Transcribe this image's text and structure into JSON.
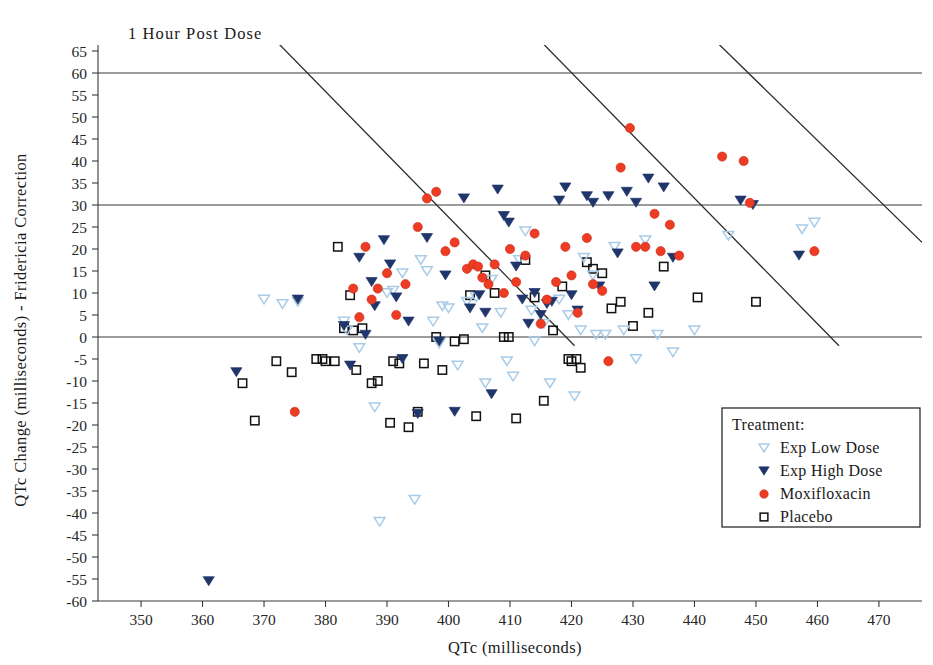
{
  "chart_data": {
    "type": "scatter",
    "title": "1 Hour Post Dose",
    "xlabel": "QTc (milliseconds)",
    "ylabel": "QTc Change (milliseconds) - Fridericia Correction",
    "xlim": [
      343,
      477
    ],
    "ylim": [
      -60,
      65
    ],
    "xticks": [
      350,
      360,
      370,
      380,
      390,
      400,
      410,
      420,
      430,
      440,
      450,
      460,
      470
    ],
    "yticks": [
      65,
      60,
      55,
      50,
      45,
      40,
      35,
      30,
      25,
      20,
      15,
      10,
      5,
      0,
      -5,
      -10,
      -15,
      -20,
      -25,
      -30,
      -35,
      -40,
      -45,
      -50,
      -55,
      -60
    ],
    "grid": false,
    "legend": {
      "position": "bottom-right",
      "title": "Treatment:",
      "entries": [
        {
          "label": "Exp Low Dose",
          "marker": "triangle-down-open",
          "color": "#A8CCE8"
        },
        {
          "label": "Exp High Dose",
          "marker": "triangle-down-filled",
          "color": "#20366B"
        },
        {
          "label": "Moxifloxacin",
          "marker": "circle-filled",
          "color": "#EE3B24"
        },
        {
          "label": "Placebo",
          "marker": "square-open",
          "color": "#111111"
        }
      ]
    },
    "reference_lines": {
      "horizontal": [
        {
          "y": 60,
          "label": ""
        },
        {
          "y": 30,
          "label": ""
        },
        {
          "y": 0,
          "label": ""
        }
      ],
      "diagonal": [
        {
          "x1": 372.5,
          "y1": 66.5,
          "x2": 420.5,
          "y2": -2.0
        },
        {
          "x1": 415.5,
          "y1": 66.5,
          "x2": 463.5,
          "y2": -2.0
        },
        {
          "x1": 444.0,
          "y1": 66.5,
          "x2": 477.0,
          "y2": 21.5
        }
      ]
    },
    "series": [
      {
        "name": "Exp Low Dose",
        "marker": "triangle-down-open",
        "color": "#A8CCE8",
        "points": [
          [
            370.0,
            8.5
          ],
          [
            373.0,
            7.5
          ],
          [
            375.5,
            8.0
          ],
          [
            383.0,
            3.5
          ],
          [
            383.5,
            1.5
          ],
          [
            385.5,
            -2.5
          ],
          [
            388.0,
            -16.0
          ],
          [
            388.8,
            -42.0
          ],
          [
            390.0,
            10.0
          ],
          [
            391.0,
            10.5
          ],
          [
            392.5,
            14.5
          ],
          [
            394.5,
            -37.0
          ],
          [
            395.5,
            17.5
          ],
          [
            396.5,
            15.0
          ],
          [
            397.5,
            3.5
          ],
          [
            398.5,
            -1.5
          ],
          [
            399.0,
            7.0
          ],
          [
            400.0,
            6.5
          ],
          [
            401.5,
            -6.5
          ],
          [
            403.0,
            8.0
          ],
          [
            404.5,
            9.0
          ],
          [
            405.5,
            2.0
          ],
          [
            406.0,
            -10.5
          ],
          [
            407.0,
            13.0
          ],
          [
            408.5,
            5.5
          ],
          [
            409.5,
            -5.5
          ],
          [
            410.5,
            -9.0
          ],
          [
            411.5,
            17.5
          ],
          [
            412.5,
            24.0
          ],
          [
            413.5,
            6.0
          ],
          [
            414.0,
            -1.0
          ],
          [
            415.5,
            3.0
          ],
          [
            416.5,
            -10.5
          ],
          [
            418.0,
            8.5
          ],
          [
            419.5,
            5.0
          ],
          [
            420.5,
            -13.5
          ],
          [
            421.5,
            1.5
          ],
          [
            422.0,
            18.0
          ],
          [
            423.5,
            14.0
          ],
          [
            424.0,
            0.5
          ],
          [
            425.5,
            0.5
          ],
          [
            427.0,
            20.5
          ],
          [
            428.5,
            1.5
          ],
          [
            430.5,
            -5.0
          ],
          [
            432.0,
            22.0
          ],
          [
            434.0,
            0.5
          ],
          [
            436.5,
            -3.5
          ],
          [
            440.0,
            1.5
          ],
          [
            445.5,
            23.0
          ],
          [
            457.5,
            24.5
          ],
          [
            459.5,
            26.0
          ]
        ]
      },
      {
        "name": "Exp High Dose",
        "marker": "triangle-down-filled",
        "color": "#20366B",
        "points": [
          [
            361.0,
            -55.5
          ],
          [
            365.5,
            -8.0
          ],
          [
            375.5,
            8.5
          ],
          [
            383.0,
            2.5
          ],
          [
            384.0,
            -6.5
          ],
          [
            385.5,
            18.0
          ],
          [
            386.5,
            0.5
          ],
          [
            387.5,
            12.5
          ],
          [
            388.0,
            7.0
          ],
          [
            389.5,
            22.0
          ],
          [
            390.5,
            16.5
          ],
          [
            391.5,
            9.0
          ],
          [
            392.5,
            -5.0
          ],
          [
            393.5,
            3.5
          ],
          [
            395.0,
            -17.5
          ],
          [
            396.5,
            22.5
          ],
          [
            398.5,
            -1.0
          ],
          [
            399.5,
            14.0
          ],
          [
            401.0,
            -17.0
          ],
          [
            402.5,
            31.5
          ],
          [
            403.5,
            6.5
          ],
          [
            405.0,
            9.5
          ],
          [
            406.0,
            5.5
          ],
          [
            407.0,
            -13.0
          ],
          [
            408.0,
            33.5
          ],
          [
            409.0,
            27.5
          ],
          [
            409.8,
            26.0
          ],
          [
            411.0,
            16.0
          ],
          [
            412.0,
            8.5
          ],
          [
            413.0,
            3.0
          ],
          [
            414.0,
            10.0
          ],
          [
            415.0,
            5.0
          ],
          [
            416.0,
            7.5
          ],
          [
            416.8,
            8.0
          ],
          [
            418.0,
            31.0
          ],
          [
            419.0,
            34.0
          ],
          [
            420.0,
            9.5
          ],
          [
            421.0,
            6.0
          ],
          [
            422.5,
            32.0
          ],
          [
            423.5,
            30.5
          ],
          [
            424.5,
            11.5
          ],
          [
            426.0,
            32.0
          ],
          [
            427.5,
            19.0
          ],
          [
            429.0,
            33.0
          ],
          [
            430.5,
            30.5
          ],
          [
            432.5,
            36.0
          ],
          [
            433.5,
            11.5
          ],
          [
            435.0,
            34.0
          ],
          [
            436.5,
            18.0
          ],
          [
            447.5,
            31.0
          ],
          [
            449.5,
            30.0
          ],
          [
            457.0,
            18.5
          ]
        ]
      },
      {
        "name": "Moxifloxacin",
        "marker": "circle-filled",
        "color": "#EE3B24",
        "points": [
          [
            375.0,
            -17.0
          ],
          [
            384.5,
            11.0
          ],
          [
            385.5,
            4.5
          ],
          [
            386.5,
            20.5
          ],
          [
            387.5,
            8.5
          ],
          [
            388.5,
            11.0
          ],
          [
            390.0,
            14.5
          ],
          [
            391.5,
            5.0
          ],
          [
            393.0,
            12.0
          ],
          [
            395.0,
            25.0
          ],
          [
            396.5,
            31.5
          ],
          [
            398.0,
            33.0
          ],
          [
            399.5,
            19.5
          ],
          [
            401.0,
            21.5
          ],
          [
            403.0,
            15.5
          ],
          [
            404.0,
            16.5
          ],
          [
            404.8,
            16.0
          ],
          [
            405.5,
            13.5
          ],
          [
            406.5,
            12.0
          ],
          [
            407.5,
            16.5
          ],
          [
            409.0,
            10.0
          ],
          [
            410.0,
            20.0
          ],
          [
            411.0,
            12.5
          ],
          [
            412.5,
            18.5
          ],
          [
            414.0,
            23.5
          ],
          [
            415.0,
            3.0
          ],
          [
            416.0,
            8.5
          ],
          [
            417.5,
            12.5
          ],
          [
            419.0,
            20.5
          ],
          [
            420.0,
            14.0
          ],
          [
            421.0,
            5.5
          ],
          [
            422.5,
            22.5
          ],
          [
            423.5,
            12.0
          ],
          [
            425.0,
            10.5
          ],
          [
            426.0,
            -5.5
          ],
          [
            428.0,
            38.5
          ],
          [
            429.5,
            47.5
          ],
          [
            430.5,
            20.5
          ],
          [
            432.0,
            20.5
          ],
          [
            433.5,
            28.0
          ],
          [
            434.5,
            19.5
          ],
          [
            436.0,
            25.5
          ],
          [
            437.5,
            18.5
          ],
          [
            444.5,
            41.0
          ],
          [
            448.0,
            40.0
          ],
          [
            449.0,
            30.5
          ],
          [
            459.5,
            19.5
          ]
        ]
      },
      {
        "name": "Placebo",
        "marker": "square-open",
        "color": "#111111",
        "points": [
          [
            366.5,
            -10.5
          ],
          [
            368.5,
            -19.0
          ],
          [
            372.0,
            -5.5
          ],
          [
            374.5,
            -8.0
          ],
          [
            378.5,
            -5.0
          ],
          [
            379.5,
            -5.0
          ],
          [
            380.0,
            -5.5
          ],
          [
            381.5,
            -5.5
          ],
          [
            382.0,
            20.5
          ],
          [
            383.0,
            2.0
          ],
          [
            384.0,
            9.5
          ],
          [
            384.5,
            1.5
          ],
          [
            385.0,
            -7.5
          ],
          [
            386.0,
            2.0
          ],
          [
            387.5,
            -10.5
          ],
          [
            388.5,
            -10.0
          ],
          [
            390.5,
            -19.5
          ],
          [
            391.0,
            -5.5
          ],
          [
            392.0,
            -6.0
          ],
          [
            393.5,
            -20.5
          ],
          [
            395.0,
            -17.0
          ],
          [
            396.0,
            -6.0
          ],
          [
            398.0,
            0.0
          ],
          [
            399.0,
            -7.5
          ],
          [
            401.0,
            -1.0
          ],
          [
            402.5,
            -0.5
          ],
          [
            403.5,
            9.5
          ],
          [
            404.5,
            -18.0
          ],
          [
            406.0,
            14.0
          ],
          [
            407.5,
            10.0
          ],
          [
            409.0,
            0.0
          ],
          [
            409.8,
            0.0
          ],
          [
            411.0,
            -18.5
          ],
          [
            412.5,
            17.5
          ],
          [
            414.0,
            9.0
          ],
          [
            415.5,
            -14.5
          ],
          [
            417.0,
            1.5
          ],
          [
            418.5,
            11.5
          ],
          [
            419.5,
            -5.0
          ],
          [
            420.0,
            -5.5
          ],
          [
            420.8,
            -5.0
          ],
          [
            421.5,
            -7.0
          ],
          [
            422.5,
            17.0
          ],
          [
            423.5,
            15.5
          ],
          [
            425.0,
            14.5
          ],
          [
            426.5,
            6.5
          ],
          [
            428.0,
            8.0
          ],
          [
            430.0,
            2.5
          ],
          [
            432.5,
            5.5
          ],
          [
            435.0,
            16.0
          ],
          [
            440.5,
            9.0
          ],
          [
            450.0,
            8.0
          ]
        ]
      }
    ]
  }
}
